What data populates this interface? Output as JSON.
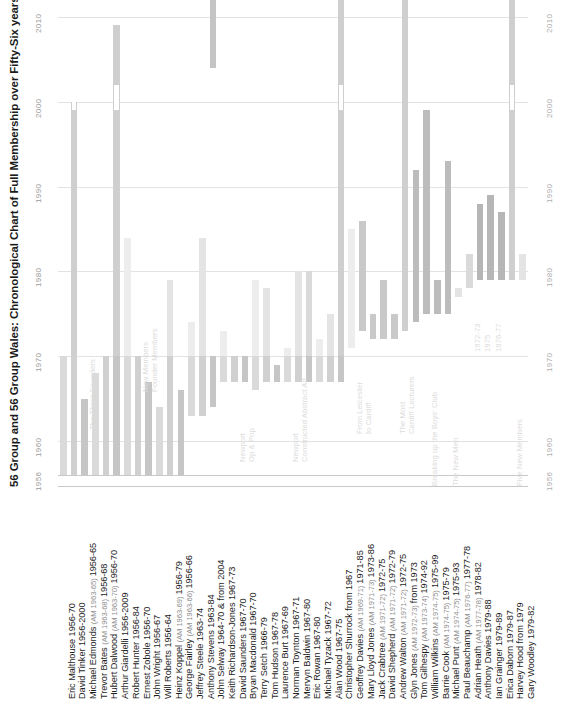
{
  "chart_data": {
    "type": "bar",
    "title": "56 Group and 56 Group Wales: Chronological Chart of Full Membership over Fifty-Six years",
    "xlabel": "",
    "ylabel": "",
    "orientation": "vertical-floating-bars",
    "ylim": [
      1956,
      2012
    ],
    "yticks": [
      1956,
      1960,
      1970,
      1980,
      1990,
      2000,
      2010
    ],
    "ytick_labels": [
      "1956",
      "1960",
      "1970",
      "1980",
      "1990",
      "2000",
      "2010"
    ],
    "grid": true,
    "legend": "none",
    "note": "Each bar is a member's span of full membership; start year at bottom, end year at top. Some members have a gap (AM period or break) shown as a white interruption.",
    "categories": [
      "Eric Malthouse  1956-70",
      "David Tinker  1956-2000",
      "Michael Edmonds  1956-65",
      "Trevor Bates  1956-68",
      "Hubert Dalwood  1956-70",
      "Arthur Giardelli  1956-2009",
      "Robert Hunter  1956-84",
      "Ernest Zobole  1956-70",
      "John Wright  1956-67",
      "Will Roberts  1956-64",
      "Heinz Koppel  1956-79",
      "George Fairley  1956-66",
      "Jeffrey Steele  1963-74",
      "Anthony Stevens  1963-84",
      "John Selway  1964-70 & from 2004",
      "Keith Richardson-Jones  1967-73",
      "David Saunders  1967-70",
      "Bryan Macdonald  1967-70",
      "Terry Setch  1966-79",
      "Tom Hudson  1967-78",
      "Laurence Burt  1967-69",
      "Norman Toynton  1967-71",
      "Mervyn Baldwin  1967-80",
      "Eric Rowan  1967-80",
      "Michael Tyzack  1967-72",
      "Alan Wood  1967-75",
      "Christopher Shurrock  from 1967",
      "Geoffrey Davies  1971-85",
      "Mary Lloyd Jones  1973-86",
      "Jack Crabtree  1972-75",
      "David Shepherd  1972-79",
      "Andrew Walton  1972-75",
      "Glyn Jones  from 1973",
      "Tom Gilhespy  1974-92",
      "William Wilkins  1975-99",
      "Barrie Cook  1975-79",
      "Michael Punt  1975-93",
      "Paul Beauchamp  1977-78",
      "Adrian Heath  1978-82",
      "Anthony Davies  1979-88",
      "Ian Grainger  1979-89",
      "Erica Daborn  1979-87",
      "Harvey Hood  from 1979",
      "Gary Woodley  1979-82"
    ],
    "spans": [
      {
        "name": "Eric Malthouse",
        "start": 1956,
        "end": 1970,
        "am": ""
      },
      {
        "name": "David Tinker",
        "start": 1956,
        "end": 2000,
        "am": ""
      },
      {
        "name": "Michael Edmonds",
        "start": 1956,
        "end": 1965,
        "am": "(AM 1963-65)"
      },
      {
        "name": "Trevor Bates",
        "start": 1956,
        "end": 1968,
        "am": "(AM 1963-68)"
      },
      {
        "name": "Hubert Dalwood",
        "start": 1956,
        "end": 1970,
        "am": "(AM 1963-70)"
      },
      {
        "name": "Arthur Giardelli",
        "start": 1956,
        "end": 2009,
        "am": ""
      },
      {
        "name": "Robert Hunter",
        "start": 1956,
        "end": 1984,
        "am": ""
      },
      {
        "name": "Ernest Zobole",
        "start": 1956,
        "end": 1970,
        "am": ""
      },
      {
        "name": "John Wright",
        "start": 1956,
        "end": 1967,
        "am": ""
      },
      {
        "name": "Will Roberts",
        "start": 1956,
        "end": 1964,
        "am": ""
      },
      {
        "name": "Heinz Koppel",
        "start": 1956,
        "end": 1979,
        "am": "(AM 1963-69)"
      },
      {
        "name": "George Fairley",
        "start": 1956,
        "end": 1966,
        "am": "(AM 1963-66)"
      },
      {
        "name": "Jeffrey Steele",
        "start": 1963,
        "end": 1974,
        "am": ""
      },
      {
        "name": "Anthony Stevens",
        "start": 1963,
        "end": 1984,
        "am": ""
      },
      {
        "name": "John Selway",
        "start": 1964,
        "end": 1970,
        "am": "",
        "second_start": 2004,
        "second_end": 2012
      },
      {
        "name": "Keith Richardson-Jones",
        "start": 1967,
        "end": 1973,
        "am": ""
      },
      {
        "name": "David Saunders",
        "start": 1967,
        "end": 1970,
        "am": ""
      },
      {
        "name": "Bryan Macdonald",
        "start": 1967,
        "end": 1970,
        "am": ""
      },
      {
        "name": "Terry Setch",
        "start": 1966,
        "end": 1979,
        "am": ""
      },
      {
        "name": "Tom Hudson",
        "start": 1967,
        "end": 1978,
        "am": ""
      },
      {
        "name": "Laurence Burt",
        "start": 1967,
        "end": 1969,
        "am": ""
      },
      {
        "name": "Norman Toynton",
        "start": 1967,
        "end": 1971,
        "am": ""
      },
      {
        "name": "Mervyn Baldwin",
        "start": 1967,
        "end": 1980,
        "am": ""
      },
      {
        "name": "Eric Rowan",
        "start": 1967,
        "end": 1980,
        "am": ""
      },
      {
        "name": "Michael Tyzack",
        "start": 1967,
        "end": 1972,
        "am": ""
      },
      {
        "name": "Alan Wood",
        "start": 1967,
        "end": 1975,
        "am": ""
      },
      {
        "name": "Christopher Shurrock",
        "start": 1967,
        "end": 2012,
        "am": ""
      },
      {
        "name": "Geoffrey Davies",
        "start": 1971,
        "end": 1985,
        "am": "(AM 1969-71)"
      },
      {
        "name": "Mary Lloyd Jones",
        "start": 1973,
        "end": 1986,
        "am": "(AM 1971-73)"
      },
      {
        "name": "Jack Crabtree",
        "start": 1972,
        "end": 1975,
        "am": "(AM 1971-72)"
      },
      {
        "name": "David Shepherd",
        "start": 1972,
        "end": 1979,
        "am": "(AM 1971-72)"
      },
      {
        "name": "Andrew Walton",
        "start": 1972,
        "end": 1975,
        "am": "(AM 1971-72)"
      },
      {
        "name": "Glyn Jones",
        "start": 1973,
        "end": 2012,
        "am": "(AM 1972-73)"
      },
      {
        "name": "Tom Gilhespy",
        "start": 1974,
        "end": 1992,
        "am": "(AM 1973-74)"
      },
      {
        "name": "William Wilkins",
        "start": 1975,
        "end": 1999,
        "am": "(AM 1974-75)"
      },
      {
        "name": "Barrie Cook",
        "start": 1975,
        "end": 1979,
        "am": "(AM 1974-75)"
      },
      {
        "name": "Michael Punt",
        "start": 1975,
        "end": 1993,
        "am": "(AM 1974-75)"
      },
      {
        "name": "Paul Beauchamp",
        "start": 1977,
        "end": 1978,
        "am": "(AM 1976-77)"
      },
      {
        "name": "Adrian Heath",
        "start": 1978,
        "end": 1982,
        "am": "(AM 1977-78)"
      },
      {
        "name": "Anthony Davies",
        "start": 1979,
        "end": 1988,
        "am": ""
      },
      {
        "name": "Ian Grainger",
        "start": 1979,
        "end": 1989,
        "am": ""
      },
      {
        "name": "Erica Daborn",
        "start": 1979,
        "end": 1987,
        "am": ""
      },
      {
        "name": "Harvey Hood",
        "start": 1979,
        "end": 2012,
        "am": ""
      },
      {
        "name": "Gary Woodley",
        "start": 1979,
        "end": 1982,
        "am": ""
      }
    ],
    "annotations": [
      {
        "label": "The Three Founders",
        "at_index": 2
      },
      {
        "label": "New Members\nFounder Members",
        "at_index": 7
      },
      {
        "label": "Newport\nOp & Pop",
        "at_index": 16
      },
      {
        "label": "Newport\nConstructed Abstract Art",
        "at_index": 21
      },
      {
        "label": "From Leicester\nto Cardiff",
        "at_index": 27
      },
      {
        "label": "The Most\nCardiff Lecturers",
        "at_index": 31
      },
      {
        "label": "Breaking up the Boys' Club",
        "at_index": 34
      },
      {
        "label": "The New Men",
        "at_index": 36
      },
      {
        "label": "1972-73",
        "at_index": 38
      },
      {
        "label": "1975",
        "at_index": 39
      },
      {
        "label": "1976-77",
        "at_index": 40
      },
      {
        "label": "Five New Members",
        "at_index": 42
      }
    ]
  },
  "axis": {
    "left_ticks": [
      "1956",
      "1960",
      "1970",
      "1980",
      "1990",
      "2000",
      "2010"
    ],
    "right_ticks": [
      "1956",
      "1960",
      "1970",
      "1980",
      "1990",
      "2000",
      "2010"
    ]
  },
  "colors": {
    "bar_light": "#e8e8e8",
    "bar_mid": "#d3d3d3",
    "bar_dark": "#b8b8b8",
    "bar_darkest": "#a8a8a8",
    "grid": "#e2e2e2",
    "text": "#1e1e1e",
    "muted": "#8e8e8e",
    "faint": "#dcdcdc"
  }
}
